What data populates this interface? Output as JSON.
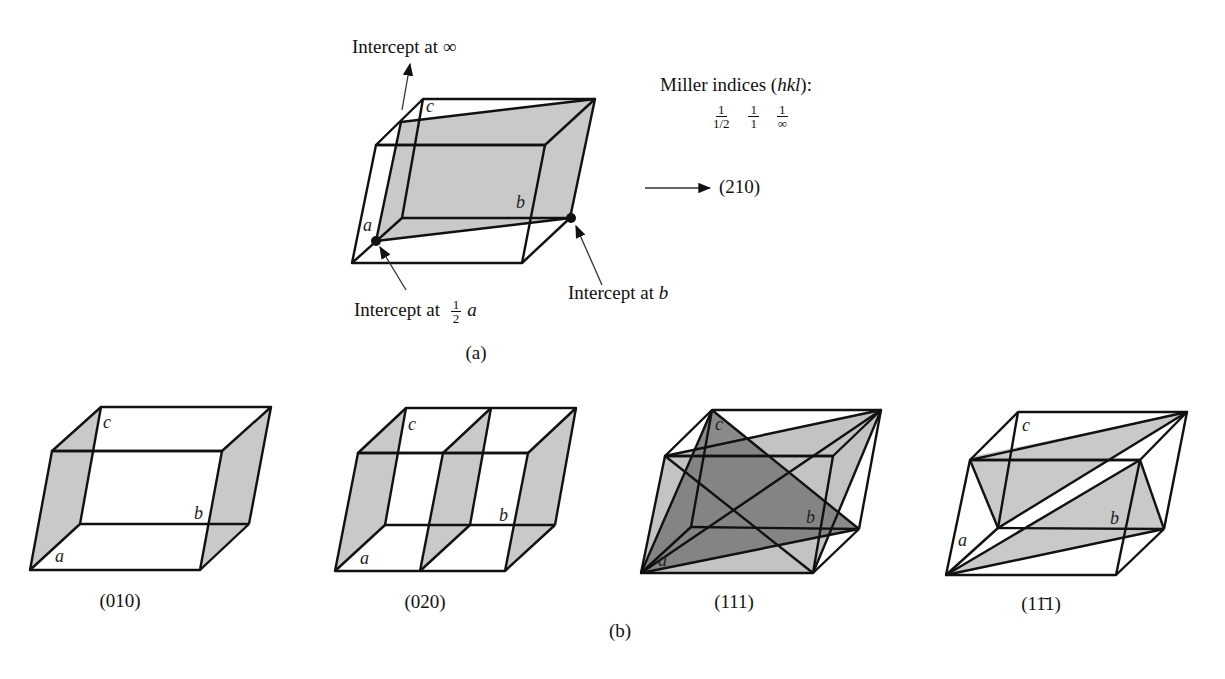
{
  "figure_a": {
    "label": "(a)",
    "intercept_c": "Intercept at ∞",
    "intercept_a_prefix": "Intercept at",
    "intercept_a_frac_num": "1",
    "intercept_a_frac_den": "2",
    "intercept_a_axis": "a",
    "intercept_b_prefix": "Intercept at",
    "intercept_b_axis": "b",
    "miller_title_prefix": "Miller indices (",
    "miller_title_hkl": "hkl",
    "miller_title_suffix": "):",
    "fractions": [
      {
        "num": "1",
        "den": "1/2"
      },
      {
        "num": "1",
        "den": "1"
      },
      {
        "num": "1",
        "den": "∞"
      }
    ],
    "result": "(210)",
    "axes": {
      "a": "a",
      "b": "b",
      "c": "c"
    }
  },
  "figure_b": {
    "label": "(b)",
    "cells": [
      {
        "caption": "(010)",
        "axes": {
          "a": "a",
          "b": "b",
          "c": "c"
        }
      },
      {
        "caption": "(020)",
        "axes": {
          "a": "a",
          "b": "b",
          "c": "c"
        }
      },
      {
        "caption": "(111)",
        "axes": {
          "a": "a",
          "b": "b",
          "c": "c"
        }
      },
      {
        "caption": "(11̄1)",
        "axes": {
          "a": "a",
          "b": "b",
          "c": "c"
        }
      }
    ]
  },
  "colors": {
    "line": "#111111",
    "plane_light": "#c8c8c8",
    "plane_dark": "#8a8a8a",
    "background": "#ffffff"
  }
}
